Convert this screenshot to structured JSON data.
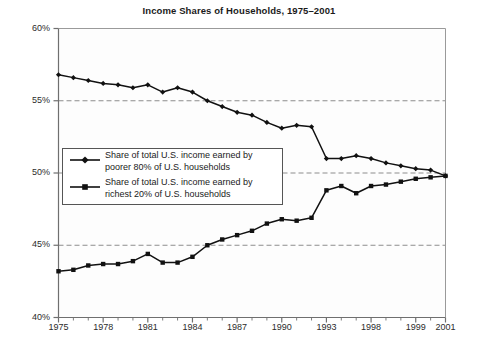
{
  "chart_data": {
    "type": "line",
    "title": "Income Shares of Households, 1975–2001",
    "xlabel": "",
    "ylabel": "",
    "ylim": [
      40,
      60
    ],
    "yticks": [
      40,
      45,
      50,
      55,
      60
    ],
    "ytick_labels": [
      "40%",
      "45%",
      "50%",
      "55%",
      "60%"
    ],
    "grid": "horizontal-dashed",
    "legend_position": "center-left-inside",
    "x": [
      "1975",
      "1976",
      "1977",
      "1978",
      "1979",
      "1980",
      "1981",
      "1982",
      "1983",
      "1984",
      "1985",
      "1986",
      "1987",
      "1988",
      "1989",
      "1990",
      "1991",
      "1992",
      "1993",
      "1994",
      "1995",
      "1996",
      "1997",
      "1998",
      "1999",
      "2000",
      "2001"
    ],
    "xtick_labels": [
      "1975",
      "1978",
      "1981",
      "1984",
      "1987",
      "1990",
      "1993",
      "1998",
      "1999",
      "2001"
    ],
    "xtick_indices": [
      0,
      3,
      6,
      9,
      12,
      15,
      18,
      21,
      24,
      26
    ],
    "series": [
      {
        "name": "Share of total U.S. income earned by poorer 80% of U.S. households",
        "short_name": "poorer-80",
        "marker": "diamond",
        "color": "#111111",
        "values": [
          56.8,
          56.6,
          56.4,
          56.2,
          56.1,
          55.9,
          56.1,
          55.6,
          55.9,
          55.6,
          55.0,
          54.6,
          54.2,
          54.0,
          53.5,
          53.1,
          53.3,
          53.2,
          51.0,
          51.0,
          51.2,
          51.0,
          50.7,
          50.5,
          50.3,
          50.2,
          49.8
        ]
      },
      {
        "name": "Share of total U.S. income earned by richest 20% of U.S. households",
        "short_name": "richest-20",
        "marker": "square",
        "color": "#111111",
        "values": [
          43.2,
          43.3,
          43.6,
          43.7,
          43.7,
          43.9,
          44.4,
          43.8,
          43.8,
          44.2,
          45.0,
          45.4,
          45.7,
          46.0,
          46.5,
          46.8,
          46.7,
          46.9,
          48.8,
          49.1,
          48.6,
          49.1,
          49.2,
          49.4,
          49.6,
          49.7,
          49.8
        ]
      }
    ]
  },
  "legend": {
    "entries": [
      {
        "line1": "Share of total U.S. income earned by",
        "line2": "poorer 80% of U.S. households"
      },
      {
        "line1": "Share of total U.S. income earned by",
        "line2": "richest 20% of U.S. households"
      }
    ]
  }
}
